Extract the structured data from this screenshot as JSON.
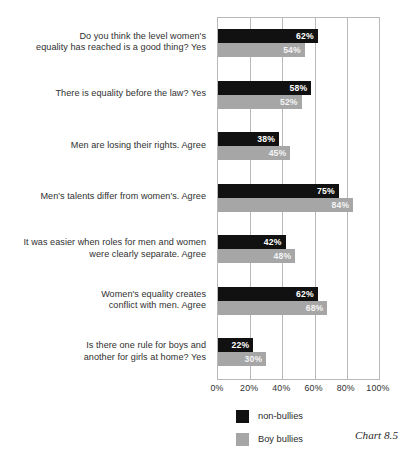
{
  "chart_data": {
    "type": "bar",
    "orientation": "horizontal",
    "title": "",
    "caption": "Chart 8.5",
    "xlabel": "",
    "ylabel": "",
    "xlim": [
      0,
      100
    ],
    "xticks": [
      "0%",
      "20%",
      "40%",
      "60%",
      "80%",
      "100%"
    ],
    "xtick_values": [
      0,
      20,
      40,
      60,
      80,
      100
    ],
    "grid": true,
    "legend_position": "bottom",
    "categories": [
      "Do you think the level women's equality has reached is a good thing? Yes",
      "There is equality before the law? Yes",
      "Men are losing their rights. Agree",
      "Men's talents differ from women's. Agree",
      "It was easier when roles for men and women were clearly separate. Agree",
      "Women's equality creates conflict with men. Agree",
      "Is there one rule for boys and another for girls at home? Yes"
    ],
    "category_lines": [
      [
        "Do you think the level women's",
        "equality has reached is a good thing? Yes"
      ],
      [
        "There is equality before the law? Yes"
      ],
      [
        "Men are losing their rights. Agree"
      ],
      [
        "Men's talents differ from women's. Agree"
      ],
      [
        "It was easier when roles for men and women",
        "were clearly separate. Agree"
      ],
      [
        "Women's equality creates",
        "conflict with men. Agree"
      ],
      [
        "Is there one rule for boys and",
        "another for girls at home? Yes"
      ]
    ],
    "series": [
      {
        "name": "non-bullies",
        "color": "#111111",
        "values": [
          62,
          58,
          38,
          75,
          42,
          62,
          22
        ],
        "labels": [
          "62%",
          "58%",
          "38%",
          "75%",
          "42%",
          "62%",
          "22%"
        ]
      },
      {
        "name": "Boy bullies",
        "color": "#a6a6a6",
        "values": [
          54,
          52,
          45,
          84,
          48,
          68,
          30
        ],
        "labels": [
          "54%",
          "52%",
          "45%",
          "84%",
          "48%",
          "68%",
          "30%"
        ]
      }
    ]
  },
  "legend": {
    "items": [
      {
        "label": "non-bullies",
        "color": "#111111"
      },
      {
        "label": "Boy bullies",
        "color": "#a6a6a6"
      }
    ]
  },
  "caption": "Chart 8.5"
}
